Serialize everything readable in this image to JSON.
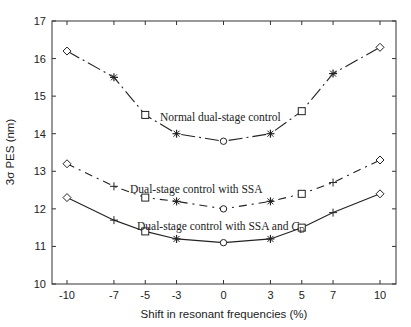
{
  "chart_data": {
    "type": "line",
    "title": "",
    "xlabel": "Shift in resonant frequencies (%)",
    "ylabel": "3σ PES (nm)",
    "x": [
      -10,
      -7,
      -5,
      -3,
      0,
      3,
      5,
      7,
      10
    ],
    "xticks": [
      "-10",
      "-7",
      "-5",
      "-3",
      "0",
      "3",
      "5",
      "7",
      "10"
    ],
    "yticks": [
      "10",
      "11",
      "12",
      "13",
      "14",
      "15",
      "16",
      "17"
    ],
    "ylim": [
      10,
      17
    ],
    "grid": false,
    "legend_position": "inline annotations",
    "series": [
      {
        "name": "Normal dual-stage control",
        "values": [
          16.2,
          15.5,
          14.5,
          14.0,
          13.8,
          14.0,
          14.6,
          15.6,
          16.3
        ],
        "line_style": "dash-dot",
        "markers": [
          "diamond",
          "star",
          "square",
          "star",
          "circle",
          "star",
          "square",
          "star",
          "diamond"
        ],
        "annotation_pos": [
          160,
          117
        ]
      },
      {
        "name": "Dual-stage control with SSA",
        "values": [
          13.2,
          12.6,
          12.3,
          12.2,
          12.0,
          12.2,
          12.4,
          12.7,
          13.3
        ],
        "line_style": "dash-dot",
        "markers": [
          "diamond",
          "plus",
          "square",
          "star",
          "circle",
          "star",
          "square",
          "plus",
          "diamond"
        ],
        "annotation_pos": [
          130,
          189
        ]
      },
      {
        "name": "Dual-stage control with SSA and C_D",
        "values": [
          12.3,
          11.7,
          11.4,
          11.2,
          11.1,
          11.2,
          11.5,
          11.9,
          12.4
        ],
        "line_style": "solid",
        "markers": [
          "diamond",
          "plus",
          "square",
          "star",
          "circle",
          "star",
          "square",
          "plus",
          "diamond"
        ],
        "annotation_pos": [
          137,
          226
        ]
      }
    ],
    "annotations": [
      "Normal dual-stage control",
      "Dual-stage control with SSA",
      "Dual-stage control with SSA and",
      "C",
      "D"
    ]
  },
  "colors": {
    "line": "#222222",
    "axis": "#333333",
    "background": "#ffffff"
  }
}
